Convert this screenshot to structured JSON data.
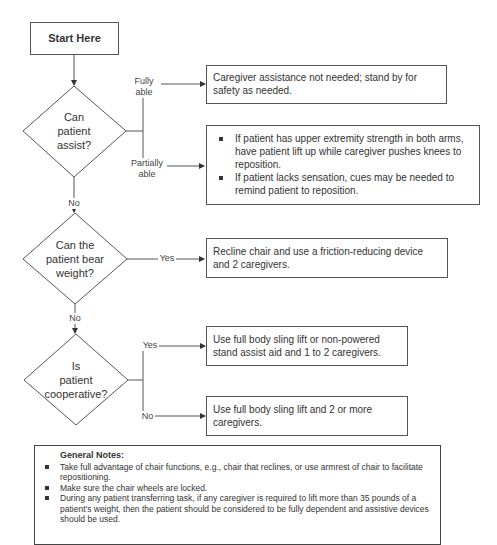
{
  "header": {
    "revision_text": "Last rev. 6/23/09"
  },
  "start": {
    "label": "Start Here"
  },
  "decisions": [
    {
      "lines": [
        "Can",
        "patient",
        "assist?"
      ],
      "exit_no": "No"
    },
    {
      "lines": [
        "Can the",
        "patient bear",
        "weight?"
      ],
      "exit_no": "No"
    },
    {
      "lines": [
        "Is",
        "patient",
        "cooperative?"
      ]
    }
  ],
  "branches": {
    "fully_able": [
      "Fully",
      "able"
    ],
    "partially_able": [
      "Partially",
      "able"
    ],
    "yes_bear": "Yes",
    "yes_coop": "Yes",
    "no_coop": "No"
  },
  "outcomes": {
    "fully_able": "Caregiver assistance not needed; stand by for safety as needed.",
    "partially_able": [
      "If patient has upper extremity strength in both arms, have patient lift up while caregiver pushes knees to reposition.",
      "If patient lacks sensation, cues may be needed to remind patient to reposition."
    ],
    "bear_weight_yes": "Recline chair and use a friction-reducing device and 2 caregivers.",
    "cooperative_yes": "Use full body sling lift or non-powered stand assist aid and 1 to 2 caregivers.",
    "cooperative_no": "Use full body sling lift and 2 or more caregivers."
  },
  "notes": {
    "title": "General Notes:",
    "items": [
      "Take full advantage of chair functions, e.g., chair that reclines, or use armrest of chair to facilitate repositioning.",
      "Make sure the chair wheels are locked.",
      "During any patient transferring task, if any caregiver is required to lift more than 35 pounds of a patient's weight, then the patient should be considered to be fully dependent and assistive devices should be used."
    ]
  }
}
